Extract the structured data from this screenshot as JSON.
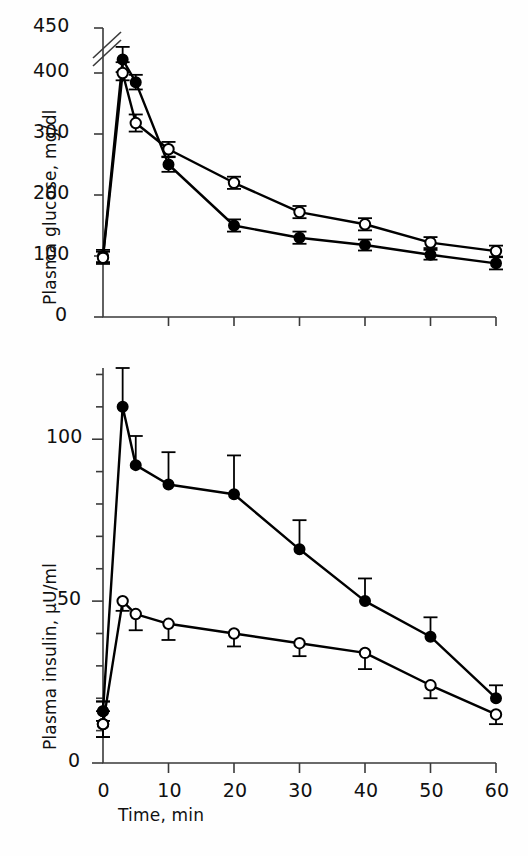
{
  "figure": {
    "background_color": "#fefefe",
    "ink_color": "#000000"
  },
  "chart_data": [
    {
      "type": "line",
      "panel": "top",
      "title": "",
      "xlabel": "",
      "ylabel": "Plasma glucose, mg/dl",
      "x": [
        0,
        3,
        5,
        10,
        20,
        30,
        40,
        50,
        60
      ],
      "xlim": [
        0,
        60
      ],
      "ylim": [
        0,
        450
      ],
      "axis_break": {
        "present": true,
        "between": [
          400,
          450
        ],
        "style": "double-slash"
      },
      "ytick_values": [
        0,
        100,
        200,
        300,
        400,
        450
      ],
      "ytick_labels": [
        "0",
        "100",
        "200",
        "300",
        "400",
        "450"
      ],
      "xtick_values": [
        0,
        10,
        20,
        30,
        40,
        50,
        60
      ],
      "xtick_labels": [
        "",
        "",
        "",
        "",
        "",
        "",
        ""
      ],
      "grid": false,
      "legend": false,
      "series": [
        {
          "name": "filled-circle-group",
          "marker": "filled-circle",
          "values": [
            100,
            415,
            385,
            250,
            150,
            130,
            118,
            102,
            88
          ],
          "errors": [
            10,
            14,
            12,
            12,
            10,
            10,
            9,
            8,
            10
          ]
        },
        {
          "name": "open-circle-group",
          "marker": "open-circle",
          "values": [
            97,
            400,
            318,
            275,
            220,
            172,
            152,
            122,
            108
          ],
          "errors": [
            10,
            12,
            14,
            12,
            10,
            10,
            10,
            9,
            9
          ]
        }
      ]
    },
    {
      "type": "line",
      "panel": "bottom",
      "title": "",
      "xlabel": "Time, min",
      "ylabel": "Plasma insulin, μU/ml",
      "x": [
        0,
        3,
        5,
        10,
        20,
        30,
        40,
        50,
        60
      ],
      "xlim": [
        0,
        60
      ],
      "ylim": [
        0,
        122
      ],
      "ytick_values": [
        0,
        10,
        20,
        30,
        40,
        50,
        60,
        70,
        80,
        90,
        100,
        110,
        120
      ],
      "ytick_labels": [
        "0",
        "",
        "",
        "",
        "",
        "50",
        "",
        "",
        "",
        "",
        "100",
        "",
        ""
      ],
      "xtick_values": [
        0,
        10,
        20,
        30,
        40,
        50,
        60
      ],
      "xtick_labels": [
        "0",
        "10",
        "20",
        "30",
        "40",
        "50",
        "60"
      ],
      "grid": false,
      "legend": false,
      "series": [
        {
          "name": "filled-circle-group",
          "marker": "filled-circle",
          "values": [
            16,
            110,
            92,
            86,
            83,
            66,
            50,
            39,
            20
          ],
          "errors": [
            3,
            12,
            9,
            10,
            12,
            9,
            7,
            6,
            4
          ]
        },
        {
          "name": "open-circle-group",
          "marker": "open-circle",
          "values": [
            12,
            50,
            46,
            43,
            40,
            37,
            34,
            24,
            15
          ],
          "errors": [
            4,
            3,
            5,
            5,
            4,
            4,
            5,
            4,
            3
          ]
        }
      ]
    }
  ],
  "labels": {
    "glucose_axis_title": "Plasma glucose, mg/dl",
    "insulin_axis_title": "Plasma insulin, μU/ml",
    "time_axis_title": "Time, min"
  }
}
